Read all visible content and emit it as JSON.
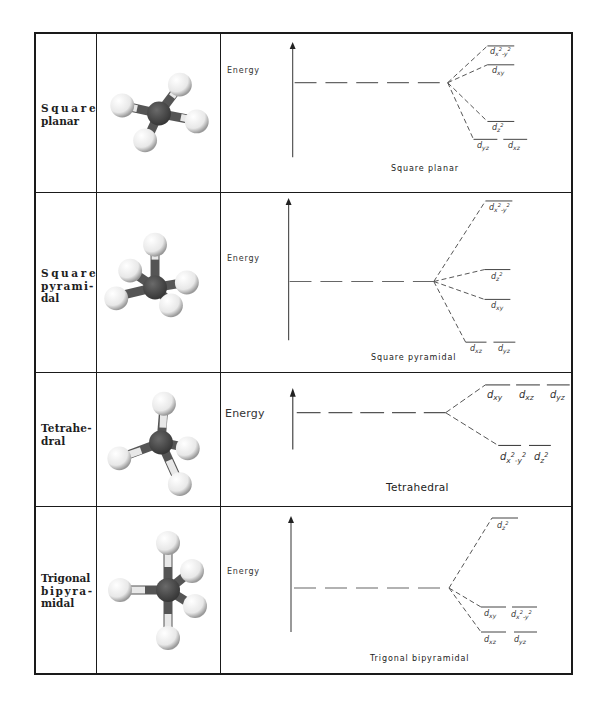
{
  "table": {
    "rows": [
      {
        "id": "square-planar",
        "name_lines": [
          "Square",
          "planar"
        ],
        "molecule": "square-planar-ball-and-stick-model",
        "energy_label": "Energy",
        "caption": "Square planar",
        "levels": [
          {
            "label": "dx²-y²",
            "rank": 4
          },
          {
            "label": "dxy",
            "rank": 3
          },
          {
            "label": "dz²",
            "rank": 2
          },
          {
            "label": "dyz",
            "rank": 1
          },
          {
            "label": "dxz",
            "rank": 1
          }
        ]
      },
      {
        "id": "square-pyramidal",
        "name_lines": [
          "Square",
          "pyrami-",
          "dal"
        ],
        "molecule": "square-pyramidal-ball-and-stick-model",
        "energy_label": "Energy",
        "caption": "Square pyramidal",
        "levels": [
          {
            "label": "dx²-y²",
            "rank": 4
          },
          {
            "label": "dz²",
            "rank": 3
          },
          {
            "label": "dxy",
            "rank": 2
          },
          {
            "label": "dxz",
            "rank": 1
          },
          {
            "label": "dyz",
            "rank": 1
          }
        ]
      },
      {
        "id": "tetrahedral",
        "name_lines": [
          "Tetrahe-",
          "dral"
        ],
        "molecule": "tetrahedral-ball-and-stick-model",
        "energy_label": "Energy",
        "caption": "Tetrahedral",
        "levels": [
          {
            "label": "dxy",
            "rank": 2
          },
          {
            "label": "dxz",
            "rank": 2
          },
          {
            "label": "dyz",
            "rank": 2
          },
          {
            "label": "dx²-y²",
            "rank": 1
          },
          {
            "label": "dz²",
            "rank": 1
          }
        ]
      },
      {
        "id": "trigonal-bipyramidal",
        "name_lines": [
          "Trigonal",
          "bipyra-",
          "midal"
        ],
        "molecule": "trigonal-bipyramidal-ball-and-stick-model",
        "energy_label": "Energy",
        "caption": "Trigonal bipyramidal",
        "levels": [
          {
            "label": "dz²",
            "rank": 3
          },
          {
            "label": "dxy",
            "rank": 2
          },
          {
            "label": "dx²-y²",
            "rank": 2
          },
          {
            "label": "dxz",
            "rank": 1
          },
          {
            "label": "dyz",
            "rank": 1
          }
        ]
      }
    ]
  },
  "colors": {
    "border": "#1a1a1a",
    "central_atom": "#4a4a4a",
    "ligand_atom": "#f2f2f2",
    "line": "#444444"
  }
}
